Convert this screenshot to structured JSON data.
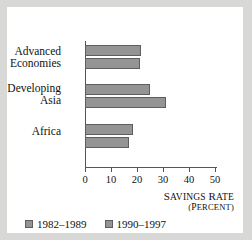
{
  "chart_data": {
    "type": "bar",
    "orientation": "horizontal",
    "title": "",
    "xlabel": "Savings rate",
    "xunit": "(percent)",
    "ylabel": "",
    "categories": [
      "Advanced Economies",
      "Developing Asia",
      "Africa"
    ],
    "category_lines": [
      [
        "Advanced",
        "Economies"
      ],
      [
        "Developing",
        "Asia"
      ],
      [
        "Africa"
      ]
    ],
    "series": [
      {
        "name": "1982–1989",
        "values": [
          21.7,
          25.0,
          18.5
        ],
        "color": "#949494"
      },
      {
        "name": "1990–1997",
        "values": [
          21.0,
          31.0,
          17.0
        ],
        "color": "#949494"
      }
    ],
    "xlim": [
      0,
      50
    ],
    "xticks": [
      0,
      10,
      20,
      30,
      40,
      50
    ],
    "xtick_labels": [
      "0",
      "10",
      "20",
      "30",
      "40",
      "50"
    ],
    "grid": false,
    "legend_position": "bottom-left",
    "bar_edge_color": "#5e5e5e",
    "axis_color": "#555555",
    "background_color": "#ffffff",
    "frame_color": "#d8d8d6"
  }
}
